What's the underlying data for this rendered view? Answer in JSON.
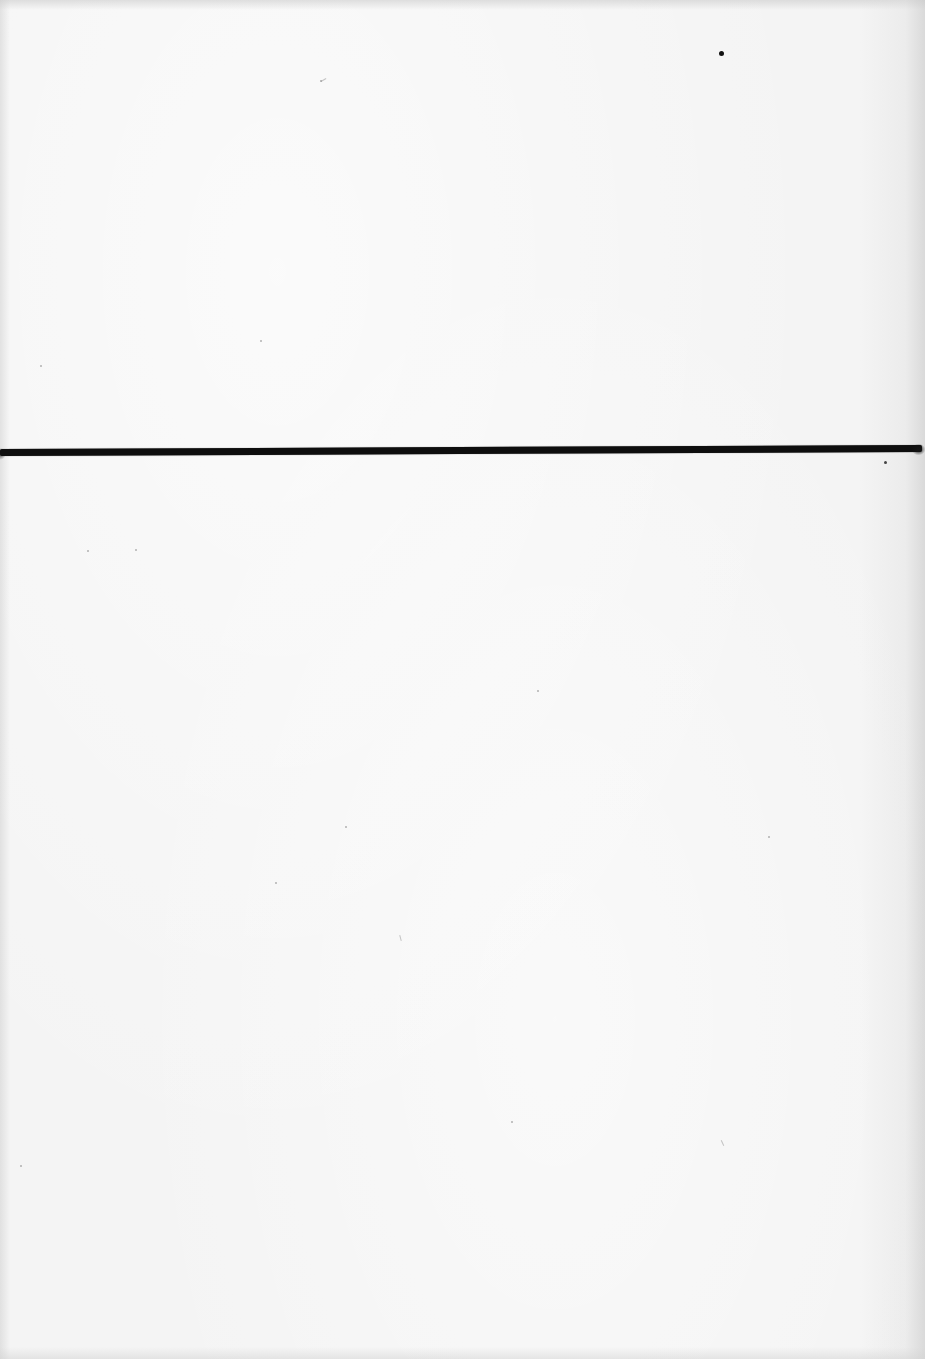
{
  "document": {
    "type": "scanned-page",
    "content": "blank page with single horizontal rule",
    "text": []
  },
  "colors": {
    "paper": "#f4f4f4",
    "rule": "#0e0e0e"
  },
  "rule": {
    "orientation": "horizontal",
    "y_left": 454,
    "y_right": 450,
    "thickness": 7
  }
}
